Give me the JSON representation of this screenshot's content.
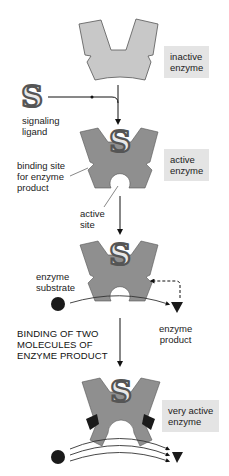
{
  "diagram": {
    "stages": [
      {
        "label": "inactive enzyme",
        "line1": "inactive",
        "line2": "enzyme"
      },
      {
        "label": "active enzyme",
        "line1": "active",
        "line2": "enzyme"
      },
      {
        "label": "very active enzyme",
        "line1": "very active",
        "line2": "enzyme"
      }
    ],
    "labels": {
      "signaling_ligand": {
        "line1": "signaling",
        "line2": "ligand"
      },
      "binding_site": {
        "line1": "binding site",
        "line2": "for enzyme",
        "line3": "product"
      },
      "active_site": {
        "line1": "active",
        "line2": "site"
      },
      "enzyme_substrate": {
        "line1": "enzyme",
        "line2": "substrate"
      },
      "enzyme_product": {
        "line1": "enzyme",
        "line2": "product"
      },
      "binding_caption": {
        "line1": "BINDING OF TWO",
        "line2": "MOLECULES OF",
        "line3": "ENZYME PRODUCT"
      }
    },
    "colors": {
      "inactive_fill": "#c8c8c8",
      "active_fill": "#8f8f8f",
      "label_box": "#e4e4e4",
      "molecule": "#1a1a1a"
    }
  }
}
